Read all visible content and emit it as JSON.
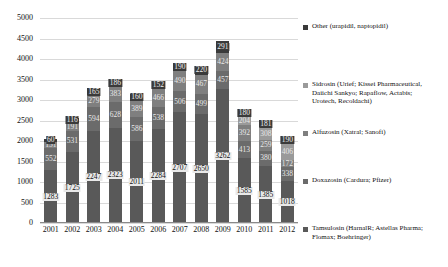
{
  "chart_data": {
    "type": "bar",
    "subtype": "stacked-column",
    "title": "",
    "xlabel": "",
    "ylabel": "",
    "ylim": [
      0,
      5000
    ],
    "ytick_step": 500,
    "yticks": [
      "5000",
      "4500",
      "4000",
      "3500",
      "3000",
      "2500",
      "2000",
      "1500",
      "1000",
      "500",
      "0"
    ],
    "grid": true,
    "legend_position": "right",
    "categories": [
      "2001",
      "2002",
      "2003",
      "2004",
      "2005",
      "2006",
      "2007",
      "2008",
      "2009",
      "2010",
      "2011",
      "2012"
    ],
    "series": [
      {
        "name": "Tamsulosin (HarnalR; Astellas Pharma; Flomax; Boehringer)",
        "color": "#595959",
        "values": [
          1283,
          1725,
          2247,
          2323,
          2011,
          2284,
          2707,
          2650,
          3262,
          1585,
          1385,
          1018
        ]
      },
      {
        "name": "Doxazosin (Cardura; Pfizer)",
        "color": "#6b6b6b",
        "values": [
          552,
          531,
          594,
          628,
          586,
          538,
          506,
          499,
          457,
          413,
          380,
          338
        ]
      },
      {
        "name": "Alfuzosin (Xatral; Sanofi)",
        "color": "#7f7f7f",
        "values": [
          151,
          191,
          279,
          383,
          389,
          466,
          490,
          467,
          424,
          392,
          259,
          172
        ]
      },
      {
        "name": "Sidrosin (Urief; Kissei Pharmaceutical, Daiichi Sankyo; Rapaflow, Actabis; Urotech, Recoldachi)",
        "color": "#9a9a9a",
        "values": [
          0,
          0,
          0,
          0,
          0,
          0,
          0,
          0,
          0,
          204,
          308,
          406
        ]
      },
      {
        "name": "Other (urapidil, naptopidil)",
        "color": "#3a3a3a",
        "values": [
          60,
          116,
          165,
          186,
          160,
          152,
          190,
          220,
          291,
          180,
          181,
          190
        ]
      }
    ],
    "bar_labels": {
      "2001": [
        "1283",
        "552",
        "151",
        "",
        "60"
      ],
      "2002": [
        "1725",
        "531",
        "191",
        "",
        "116"
      ],
      "2003": [
        "2247",
        "594",
        "279",
        "",
        "165"
      ],
      "2004": [
        "2323",
        "628",
        "383",
        "",
        "186"
      ],
      "2005": [
        "2011",
        "586",
        "389",
        "",
        "160"
      ],
      "2006": [
        "2284",
        "538",
        "466",
        "",
        "152"
      ],
      "2007": [
        "2707",
        "506",
        "490",
        "",
        "190"
      ],
      "2008": [
        "2650",
        "499",
        "467",
        "",
        "220"
      ],
      "2009": [
        "3262",
        "457",
        "424",
        "",
        "291"
      ],
      "2010": [
        "1585",
        "413",
        "392",
        "204",
        "180"
      ],
      "2011": [
        "1385",
        "380",
        "259",
        "308",
        "181"
      ],
      "2012": [
        "1018",
        "338",
        "172",
        "406",
        "190"
      ]
    }
  },
  "legend": {
    "entries": [
      {
        "label": "Other (urapidil, naptopidil)",
        "color": "#3a3a3a"
      },
      {
        "label": "Sidrosin (Urief; Kissei Pharmaceutical,\nDaiichi Sankyo; Rapaflow, Actabis;\nUrotech, Recoldachi)",
        "color": "#9a9a9a"
      },
      {
        "label": "Alfuzosin (Xatral; Sanofi)",
        "color": "#7f7f7f"
      },
      {
        "label": "Doxazosin (Cardura; Pfizer)",
        "color": "#6b6b6b"
      },
      {
        "label": "Tamsulosin (HarnalR; Astellas Pharma;\nFlomax; Boehringer)",
        "color": "#595959"
      }
    ]
  }
}
